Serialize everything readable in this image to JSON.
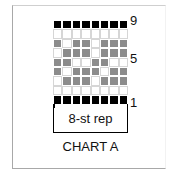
{
  "chart": {
    "title": "CHART A",
    "repeat_label": "8-st rep",
    "row_labels": {
      "top": "9",
      "middle": "5",
      "bottom": "1"
    },
    "legend": {
      "B": "black",
      "G": "gray",
      "W": "white"
    },
    "colors": {
      "B": "#000000",
      "G": "#8c8c8c",
      "W": "#ffffff"
    },
    "rows_top_to_bottom": [
      {
        "row": 9,
        "cells": [
          "B",
          "B",
          "B",
          "B",
          "B",
          "B",
          "B",
          "B"
        ]
      },
      {
        "row": 8,
        "cells": [
          "W",
          "W",
          "W",
          "W",
          "W",
          "W",
          "W",
          "W"
        ]
      },
      {
        "row": 7,
        "cells": [
          "G",
          "W",
          "G",
          "G",
          "W",
          "G",
          "G",
          "G"
        ]
      },
      {
        "row": 6,
        "cells": [
          "W",
          "G",
          "G",
          "G",
          "W",
          "G",
          "G",
          "G"
        ]
      },
      {
        "row": 5,
        "cells": [
          "G",
          "G",
          "W",
          "W",
          "G",
          "G",
          "W",
          "W"
        ]
      },
      {
        "row": 4,
        "cells": [
          "G",
          "W",
          "G",
          "G",
          "G",
          "W",
          "G",
          "G"
        ]
      },
      {
        "row": 3,
        "cells": [
          "W",
          "G",
          "G",
          "G",
          "W",
          "G",
          "G",
          "G"
        ]
      },
      {
        "row": 2,
        "cells": [
          "W",
          "W",
          "W",
          "W",
          "W",
          "W",
          "W",
          "W"
        ]
      },
      {
        "row": 1,
        "cells": [
          "B",
          "B",
          "B",
          "B",
          "B",
          "B",
          "B",
          "B"
        ]
      }
    ]
  }
}
